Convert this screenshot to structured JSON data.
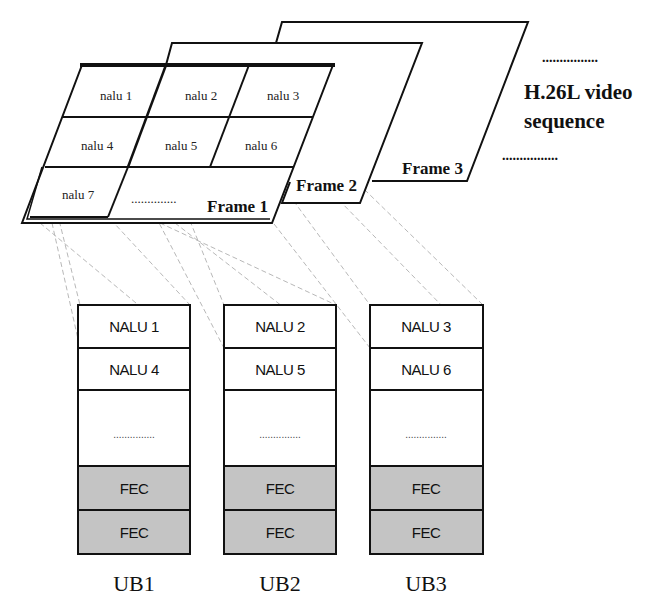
{
  "diagram": {
    "sequence_label": {
      "line1": "H.26L video",
      "line2": "sequence",
      "dots": "................"
    },
    "frames": [
      {
        "id": "frame1",
        "label": "Frame 1"
      },
      {
        "id": "frame2",
        "label": "Frame 2"
      },
      {
        "id": "frame3",
        "label": "Frame 3"
      }
    ],
    "frame1_cells": [
      {
        "label": "nalu 1"
      },
      {
        "label": "nalu 2"
      },
      {
        "label": "nalu 3"
      },
      {
        "label": "nalu 4"
      },
      {
        "label": "nalu 5"
      },
      {
        "label": "nalu 6"
      },
      {
        "label": "nalu 7"
      }
    ],
    "frame1_ellipsis": "..............",
    "blocks": [
      {
        "label": "UB1",
        "rows": [
          "NALU 1",
          "NALU 4",
          "...............",
          "FEC",
          "FEC"
        ]
      },
      {
        "label": "UB2",
        "rows": [
          "NALU 2",
          "NALU 5",
          "...............",
          "FEC",
          "FEC"
        ]
      },
      {
        "label": "UB3",
        "rows": [
          "NALU 3",
          "NALU 6",
          "...............",
          "FEC",
          "FEC"
        ]
      }
    ],
    "colors": {
      "line": "#111111",
      "fec_fill": "#c4c4c4",
      "connector": "#b8b8b8",
      "background": "#ffffff"
    }
  }
}
